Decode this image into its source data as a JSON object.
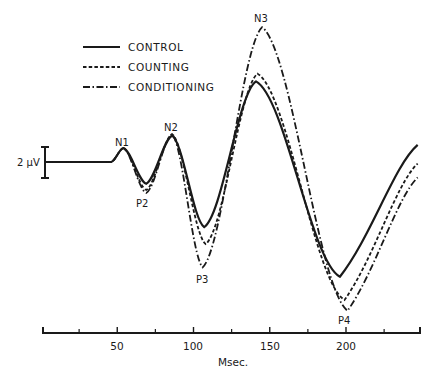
{
  "chart_data": {
    "type": "line",
    "title": "",
    "xlabel": "Msec.",
    "ylabel": "",
    "xlim": [
      0,
      247
    ],
    "x_ticks": [
      50,
      100,
      150,
      200
    ],
    "x_minor_ticks": [
      25,
      75,
      125,
      175,
      225
    ],
    "grid": false,
    "legend_position": "upper-left",
    "calibration": {
      "label": "2 µV",
      "value_uv": 2
    },
    "peak_labels": [
      {
        "label": "N1",
        "x": 54,
        "series": "all"
      },
      {
        "label": "P2",
        "x": 69,
        "series": "all"
      },
      {
        "label": "N2",
        "x": 86,
        "series": "all"
      },
      {
        "label": "P3",
        "x": 107,
        "series": "all"
      },
      {
        "label": "N3",
        "x": 145,
        "series": "all"
      },
      {
        "label": "P4",
        "x": 200,
        "series": "all"
      }
    ],
    "series": [
      {
        "name": "CONTROL",
        "style": "solid",
        "x": [
          3,
          46,
          54,
          69,
          86,
          107,
          141,
          196,
          247
        ],
        "values": [
          0.0,
          0.0,
          0.9,
          -1.4,
          1.7,
          -4.2,
          5.2,
          -7.4,
          1.1
        ]
      },
      {
        "name": "COUNTING",
        "style": "dashed",
        "x": [
          3,
          46,
          54,
          69,
          86,
          108,
          142,
          199,
          247
        ],
        "values": [
          0.0,
          0.0,
          0.9,
          -1.8,
          1.8,
          -5.3,
          5.7,
          -8.9,
          -0.1
        ]
      },
      {
        "name": "CONDITIONING",
        "style": "dashdot",
        "x": [
          3,
          46,
          54,
          69,
          86,
          106,
          145,
          201,
          247
        ],
        "values": [
          0.0,
          0.0,
          0.9,
          -2.0,
          1.8,
          -6.8,
          8.7,
          -9.6,
          -1.0
        ]
      }
    ]
  },
  "legend": {
    "items": [
      {
        "label": "CONTROL",
        "style": "solid"
      },
      {
        "label": "COUNTING",
        "style": "dashed"
      },
      {
        "label": "CONDITIONING",
        "style": "dashdot"
      }
    ]
  },
  "axis": {
    "xlabel": "Msec.",
    "tick_labels": [
      "50",
      "100",
      "150",
      "200"
    ]
  },
  "calibration_label": "2 µV",
  "peaks": {
    "n1": "N1",
    "p2": "P2",
    "n2": "N2",
    "p3": "P3",
    "n3": "N3",
    "p4": "P4"
  },
  "colors": {
    "ink": "#1a1a1a",
    "background": "#ffffff"
  }
}
